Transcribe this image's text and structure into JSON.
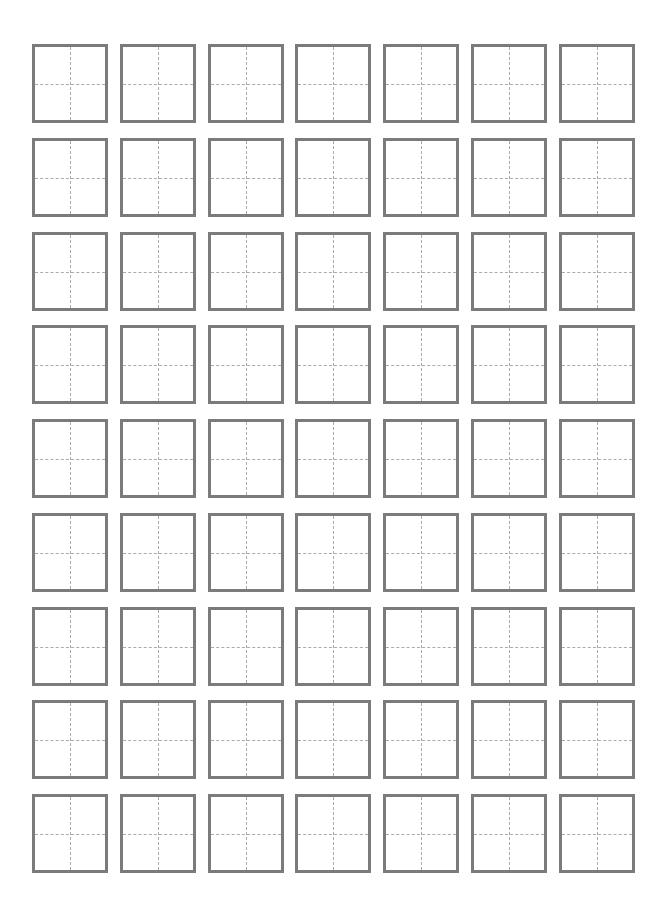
{
  "document": {
    "type": "tianzige-practice-sheet",
    "rows": 9,
    "columns": 7,
    "cell_count": 63,
    "grid": {
      "origin_x": 32,
      "origin_y": 44,
      "pitch_x": 87.8,
      "pitch_y": 93.75,
      "cell_width": 76,
      "cell_height": 79
    },
    "colors": {
      "background": "#ffffff",
      "cell_border": "#7b7b7b",
      "guide_lines": "#ababab"
    },
    "guide_style": "dashed cross (vertical and horizontal center lines)"
  }
}
